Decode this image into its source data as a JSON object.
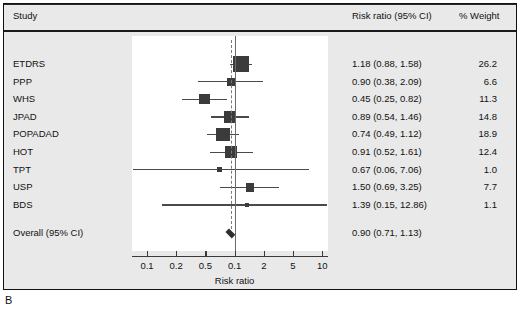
{
  "figure": {
    "label": "B"
  },
  "header": {
    "study": "Study",
    "risk_ratio": "Risk ratio (95% CI)",
    "weight": "% Weight"
  },
  "axis": {
    "title": "Risk ratio",
    "ticks": [
      "0.1",
      "0.2",
      "0.5",
      "0.1",
      "2",
      "5",
      "10"
    ]
  },
  "colors": {
    "panel_background": "#e9e9e9",
    "plot_background": "#ffffff",
    "marker": "#3b3b3b",
    "line": "#4a4a4a",
    "null_line": "#6b6b6b",
    "text": "#111111"
  },
  "chart_data": {
    "type": "forest",
    "title": "",
    "xlabel": "Risk ratio",
    "ylabel": "",
    "xscale": "log",
    "xlim": [
      0.07,
      14
    ],
    "null_value": 1.0,
    "grid": false,
    "tick_values": [
      0.1,
      0.2,
      0.5,
      1,
      2,
      5,
      10
    ],
    "tick_labels": [
      "0.1",
      "0.2",
      "0.5",
      "0.1",
      "2",
      "5",
      "10"
    ],
    "columns": [
      "Study",
      "Risk ratio (95% CI)",
      "% Weight"
    ],
    "studies": [
      {
        "name": "ETDRS",
        "estimate": 1.18,
        "lower": 0.88,
        "upper": 1.58,
        "text": "1.18 (0.88, 1.58)",
        "weight": 26.2,
        "weight_text": "26.2"
      },
      {
        "name": "PPP",
        "estimate": 0.9,
        "lower": 0.38,
        "upper": 2.09,
        "text": "0.90 (0.38, 2.09)",
        "weight": 6.6,
        "weight_text": "6.6"
      },
      {
        "name": "WHS",
        "estimate": 0.45,
        "lower": 0.25,
        "upper": 0.82,
        "text": "0.45 (0.25, 0.82)",
        "weight": 11.3,
        "weight_text": "11.3"
      },
      {
        "name": "JPAD",
        "estimate": 0.89,
        "lower": 0.54,
        "upper": 1.46,
        "text": "0.89 (0.54, 1.46)",
        "weight": 14.8,
        "weight_text": "14.8"
      },
      {
        "name": "POPADAD",
        "estimate": 0.74,
        "lower": 0.49,
        "upper": 1.12,
        "text": "0.74 (0.49, 1.12)",
        "weight": 18.9,
        "weight_text": "18.9"
      },
      {
        "name": "HOT",
        "estimate": 0.91,
        "lower": 0.52,
        "upper": 1.61,
        "text": "0.91 (0.52, 1.61)",
        "weight": 12.4,
        "weight_text": "12.4"
      },
      {
        "name": "TPT",
        "estimate": 0.67,
        "lower": 0.06,
        "upper": 7.06,
        "text": "0.67 (0.06, 7.06)",
        "weight": 1.0,
        "weight_text": "1.0"
      },
      {
        "name": "USP",
        "estimate": 1.5,
        "lower": 0.69,
        "upper": 3.25,
        "text": "1.50 (0.69, 3.25)",
        "weight": 7.7,
        "weight_text": "7.7"
      },
      {
        "name": "BDS",
        "estimate": 1.39,
        "lower": 0.15,
        "upper": 12.86,
        "text": "1.39 (0.15, 12.86)",
        "weight": 1.1,
        "weight_text": "1.1"
      }
    ],
    "overall": {
      "name": "Overall (95% CI)",
      "estimate": 0.9,
      "lower": 0.71,
      "upper": 1.13,
      "text": "0.90 (0.71, 1.13)",
      "weight_text": ""
    }
  }
}
